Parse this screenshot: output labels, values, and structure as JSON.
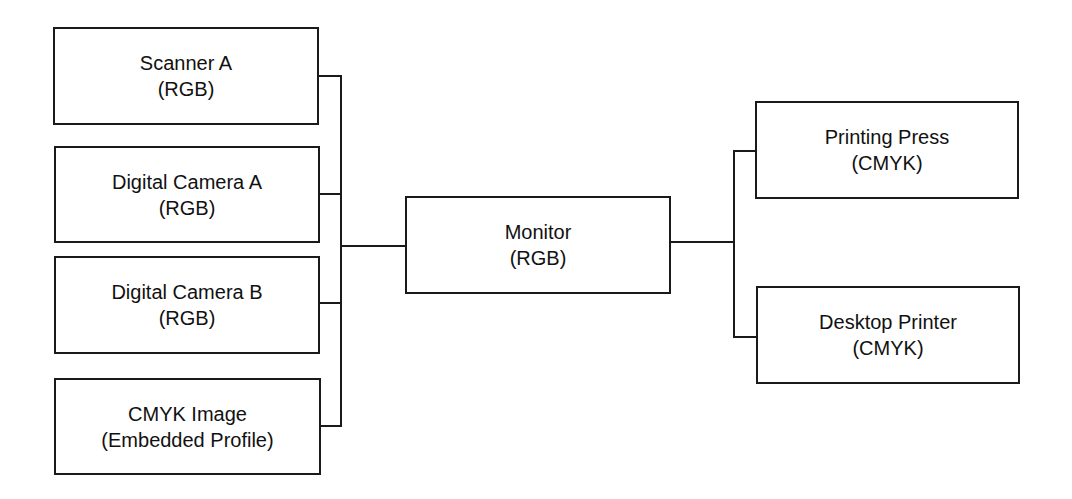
{
  "diagram": {
    "type": "flow",
    "sources": [
      {
        "id": "scanner-a",
        "name": "Scanner A",
        "space": "(RGB)"
      },
      {
        "id": "digital-camera-a",
        "name": "Digital Camera A",
        "space": "(RGB)"
      },
      {
        "id": "digital-camera-b",
        "name": "Digital Camera B",
        "space": "(RGB)"
      },
      {
        "id": "cmyk-image",
        "name": "CMYK Image",
        "space": "(Embedded Profile)"
      }
    ],
    "hub": {
      "id": "monitor",
      "name": "Monitor",
      "space": "(RGB)"
    },
    "outputs": [
      {
        "id": "printing-press",
        "name": "Printing Press",
        "space": "(CMYK)"
      },
      {
        "id": "desktop-printer",
        "name": "Desktop Printer",
        "space": "(CMYK)"
      }
    ],
    "edges": [
      [
        "scanner-a",
        "monitor"
      ],
      [
        "digital-camera-a",
        "monitor"
      ],
      [
        "digital-camera-b",
        "monitor"
      ],
      [
        "cmyk-image",
        "monitor"
      ],
      [
        "monitor",
        "printing-press"
      ],
      [
        "monitor",
        "desktop-printer"
      ]
    ]
  }
}
